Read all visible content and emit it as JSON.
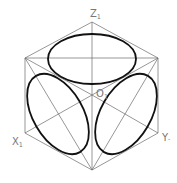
{
  "diagram": {
    "labels": {
      "z": {
        "main": "Z",
        "sub": "1"
      },
      "o": {
        "main": "O",
        "sub": "1"
      },
      "x": {
        "main": "X",
        "sub": "1"
      },
      "y": {
        "main": "Y",
        "sub": "-"
      }
    },
    "colors": {
      "thin_line": "#6a6a6a",
      "ellipse": "#111111",
      "label": "#777777",
      "background": "#ffffff"
    }
  }
}
